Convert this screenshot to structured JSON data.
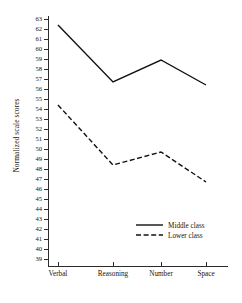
{
  "chart_data": {
    "type": "line",
    "title": "",
    "xlabel": "",
    "ylabel": "Normalized scale scores",
    "categories": [
      "Verbal",
      "Reasoning",
      "Number",
      "Space"
    ],
    "series": [
      {
        "name": "Middle class",
        "style": "solid",
        "values": [
          62.4,
          56.7,
          58.9,
          56.4
        ]
      },
      {
        "name": "Lower class",
        "style": "dashed",
        "values": [
          54.4,
          48.4,
          49.7,
          46.7
        ]
      }
    ],
    "ylim": [
      39,
      63
    ],
    "ytick_step": 1,
    "yticks": [
      39,
      40,
      41,
      42,
      43,
      44,
      45,
      46,
      47,
      48,
      49,
      50,
      51,
      52,
      53,
      54,
      55,
      56,
      57,
      58,
      59,
      60,
      61,
      62,
      63
    ],
    "grid": false,
    "legend_position": "inside-lower-right",
    "legend": [
      "Middle class",
      "Lower class"
    ],
    "line_color": "#111111"
  }
}
